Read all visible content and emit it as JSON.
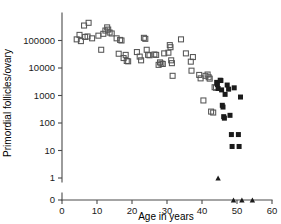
{
  "chart_data": {
    "type": "scatter",
    "title": "",
    "xlabel": "Age in years",
    "ylabel": "Primordial follicles/ovary",
    "xlim": [
      0,
      60
    ],
    "ylim": [
      1,
      1000000
    ],
    "yscale": "log",
    "y_axis_break": true,
    "y_break_note": "axis break between 1 and 0",
    "grid": false,
    "legend": "none",
    "xticks": [
      0,
      10,
      20,
      30,
      40,
      50,
      60
    ],
    "xtick_labels": [
      "0",
      "10",
      "20",
      "30",
      "40",
      "50",
      "60"
    ],
    "yticks": [
      100000,
      10000,
      1000,
      100,
      10,
      1,
      0
    ],
    "ytick_labels": [
      "100000",
      "10000",
      "1000",
      "100",
      "10",
      "1",
      "0"
    ],
    "series": [
      {
        "name": "open-square",
        "marker": "open square",
        "color": "#555555",
        "points": [
          [
            4.2,
            110000
          ],
          [
            5.0,
            160000
          ],
          [
            5.4,
            95000
          ],
          [
            6.3,
            350000
          ],
          [
            6.6,
            135000
          ],
          [
            7.3,
            140000
          ],
          [
            7.6,
            440000
          ],
          [
            8.6,
            120000
          ],
          [
            10.4,
            150000
          ],
          [
            11.2,
            46000
          ],
          [
            11.8,
            175000
          ],
          [
            12.4,
            230000
          ],
          [
            12.9,
            300000
          ],
          [
            13.2,
            250000
          ],
          [
            13.6,
            195000
          ],
          [
            14.2,
            180000
          ],
          [
            15.6,
            120000
          ],
          [
            16.2,
            33000
          ],
          [
            16.6,
            105000
          ],
          [
            17.0,
            100000
          ],
          [
            17.6,
            23000
          ],
          [
            18.2,
            30000
          ],
          [
            18.5,
            18000
          ],
          [
            18.9,
            17500
          ],
          [
            21.4,
            38000
          ],
          [
            22.2,
            26000
          ],
          [
            22.6,
            19000
          ],
          [
            23.4,
            125000
          ],
          [
            23.8,
            115000
          ],
          [
            24.2,
            46000
          ],
          [
            24.6,
            30000
          ],
          [
            25.0,
            29000
          ],
          [
            26.4,
            31000
          ],
          [
            26.9,
            30000
          ],
          [
            27.6,
            13000
          ],
          [
            28.0,
            16000
          ],
          [
            28.4,
            14500
          ],
          [
            28.8,
            14000
          ],
          [
            29.2,
            34000
          ],
          [
            30.4,
            36000
          ],
          [
            30.8,
            68000
          ],
          [
            31.0,
            57000
          ],
          [
            31.2,
            19000
          ],
          [
            31.4,
            15000
          ],
          [
            31.6,
            5200
          ],
          [
            34.0,
            110000
          ],
          [
            35.4,
            34000
          ],
          [
            36.8,
            17000
          ],
          [
            37.0,
            8000
          ],
          [
            37.4,
            25000
          ],
          [
            39.2,
            5600
          ],
          [
            39.6,
            4200
          ],
          [
            40.4,
            660
          ],
          [
            41.0,
            5200
          ],
          [
            41.6,
            5800
          ],
          [
            41.9,
            4600
          ],
          [
            42.2,
            4100
          ],
          [
            42.6,
            260
          ],
          [
            43.2,
            240
          ],
          [
            43.6,
            2000
          ],
          [
            44.0,
            1900
          ]
        ]
      },
      {
        "name": "filled-square",
        "marker": "filled square",
        "color": "#1b1b1b",
        "points": [
          [
            44.2,
            3000
          ],
          [
            44.4,
            2500
          ],
          [
            44.6,
            1800
          ],
          [
            45.2,
            3600
          ],
          [
            45.4,
            3500
          ],
          [
            45.6,
            1600
          ],
          [
            45.8,
            440
          ],
          [
            46.0,
            380
          ],
          [
            46.2,
            170
          ],
          [
            46.4,
            150
          ],
          [
            46.6,
            1100
          ],
          [
            47.2,
            2400
          ],
          [
            47.6,
            1700
          ],
          [
            48.0,
            190
          ],
          [
            48.4,
            38
          ],
          [
            48.6,
            14
          ],
          [
            49.2,
            1900
          ],
          [
            50.4,
            38
          ],
          [
            50.6,
            14
          ],
          [
            51.0,
            880
          ]
        ]
      },
      {
        "name": "filled-triangle",
        "marker": "filled triangle",
        "color": "#1b1b1b",
        "points": [
          [
            44.6,
            1
          ]
        ]
      },
      {
        "name": "filled-triangle-zero",
        "marker": "filled triangle",
        "color": "#1b1b1b",
        "note": "plotted at zero, below the axis break",
        "points": [
          [
            49.0,
            0
          ],
          [
            51.4,
            0
          ],
          [
            54.4,
            0
          ]
        ]
      }
    ]
  }
}
